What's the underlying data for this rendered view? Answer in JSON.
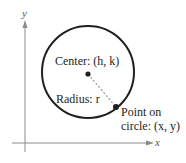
{
  "axes": {
    "x_label": "x",
    "y_label": "y",
    "color": "#8a8a8a"
  },
  "circle": {
    "stroke_color": "#231f20"
  },
  "labels": {
    "center": "Center: (h, k)",
    "radius": "Radius: r",
    "point_line1": "Point on",
    "point_line2": "circle: (x, y)"
  }
}
